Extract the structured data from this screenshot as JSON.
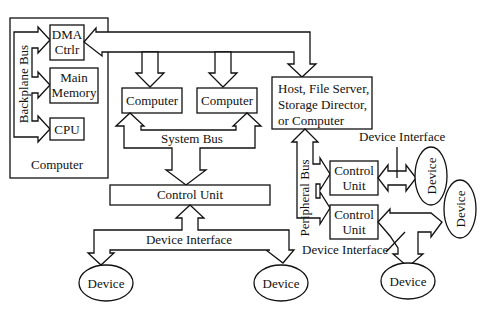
{
  "diagram": {
    "computer_group": {
      "label": "Computer",
      "bus_label": "Backplane Bus",
      "dma_line1": "DMA",
      "dma_line2": "Ctrlr",
      "memory_line1": "Main",
      "memory_line2": "Memory",
      "cpu": "CPU"
    },
    "computer_a": "Computer",
    "computer_b": "Computer",
    "system_bus": "System Bus",
    "control_unit_main": "Control Unit",
    "device_interface_left": "Device Interface",
    "device_left_1": "Device",
    "device_left_2": "Device",
    "host": {
      "line1": "Host, File Server,",
      "line2": "Storage Director,",
      "line3": "or Computer"
    },
    "peripheral_bus": "Peripheral Bus",
    "device_interface_top": "Device Interface",
    "device_interface_bottom": "Device Interface",
    "control_unit_1_line1": "Control",
    "control_unit_1_line2": "Unit",
    "control_unit_2_line1": "Control",
    "control_unit_2_line2": "Unit",
    "device_right_1": "Device",
    "device_right_2": "Device",
    "device_right_3": "Device"
  },
  "colors": {
    "stroke": "#111111",
    "background": "#ffffff"
  }
}
